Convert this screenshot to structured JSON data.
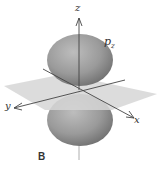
{
  "figure": {
    "panel_label": "B",
    "orbital_label": "p",
    "orbital_subscript": "z",
    "axes": {
      "x": "x",
      "y": "y",
      "z": "z"
    },
    "colors": {
      "lobe": "#8f8f8f",
      "lobe_highlight": "#b8b8b8",
      "plane": "#d4d4d4",
      "axis": "#444444"
    }
  }
}
